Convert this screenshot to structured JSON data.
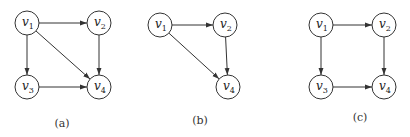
{
  "colors": {
    "stroke": "#333333",
    "text": "#222222",
    "background": "#ffffff"
  },
  "graphs": [
    {
      "caption": "(a)",
      "caption_pos": [
        62,
        127
      ],
      "nodes": [
        {
          "id": "v1",
          "base": "v",
          "sub": "1",
          "x": 27,
          "y": 23
        },
        {
          "id": "v2",
          "base": "v",
          "sub": "2",
          "x": 99,
          "y": 23
        },
        {
          "id": "v3",
          "base": "v",
          "sub": "3",
          "x": 27,
          "y": 87
        },
        {
          "id": "v4",
          "base": "v",
          "sub": "4",
          "x": 99,
          "y": 87
        }
      ],
      "edges": [
        {
          "from": "v1",
          "to": "v2"
        },
        {
          "from": "v1",
          "to": "v3"
        },
        {
          "from": "v1",
          "to": "v4"
        },
        {
          "from": "v2",
          "to": "v4"
        },
        {
          "from": "v3",
          "to": "v4"
        }
      ]
    },
    {
      "caption": "(b)",
      "caption_pos": [
        200,
        124
      ],
      "nodes": [
        {
          "id": "v1",
          "base": "v",
          "sub": "1",
          "x": 160,
          "y": 25
        },
        {
          "id": "v2",
          "base": "v",
          "sub": "2",
          "x": 225,
          "y": 25
        },
        {
          "id": "v4",
          "base": "v",
          "sub": "4",
          "x": 228,
          "y": 87
        }
      ],
      "edges": [
        {
          "from": "v1",
          "to": "v2"
        },
        {
          "from": "v1",
          "to": "v4"
        },
        {
          "from": "v2",
          "to": "v4"
        }
      ]
    },
    {
      "caption": "(c)",
      "caption_pos": [
        360,
        121
      ],
      "nodes": [
        {
          "id": "v1",
          "base": "v",
          "sub": "1",
          "x": 321,
          "y": 25
        },
        {
          "id": "v2",
          "base": "v",
          "sub": "2",
          "x": 384,
          "y": 25
        },
        {
          "id": "v3",
          "base": "v",
          "sub": "3",
          "x": 321,
          "y": 87
        },
        {
          "id": "v4",
          "base": "v",
          "sub": "4",
          "x": 384,
          "y": 87
        }
      ],
      "edges": [
        {
          "from": "v1",
          "to": "v2"
        },
        {
          "from": "v1",
          "to": "v3"
        },
        {
          "from": "v2",
          "to": "v4"
        },
        {
          "from": "v3",
          "to": "v4"
        }
      ]
    }
  ],
  "node_radius": 12
}
